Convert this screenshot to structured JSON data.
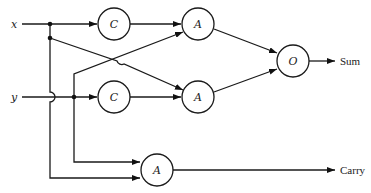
{
  "diagram": {
    "type": "half-adder logic circuit",
    "inputs": [
      {
        "id": "x",
        "label": "x"
      },
      {
        "id": "y",
        "label": "y"
      }
    ],
    "gates": [
      {
        "id": "C1",
        "label": "C",
        "input": "x"
      },
      {
        "id": "C2",
        "label": "C",
        "input": "y"
      },
      {
        "id": "A1",
        "label": "A",
        "inputs": [
          "C1",
          "y"
        ]
      },
      {
        "id": "A2",
        "label": "A",
        "inputs": [
          "x",
          "C2"
        ]
      },
      {
        "id": "O1",
        "label": "O",
        "inputs": [
          "A1",
          "A2"
        ]
      },
      {
        "id": "A3",
        "label": "A",
        "inputs": [
          "y",
          "x"
        ]
      }
    ],
    "outputs": [
      {
        "id": "sum",
        "label": "Sum",
        "from": "O1"
      },
      {
        "id": "carry",
        "label": "Carry",
        "from": "A3"
      }
    ]
  }
}
